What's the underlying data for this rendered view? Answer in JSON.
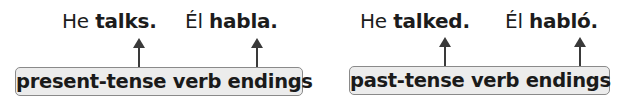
{
  "diagram": {
    "groups": [
      {
        "id": "present",
        "english": {
          "subject": "He",
          "verb": "talks."
        },
        "spanish": {
          "subject": "Él",
          "verb": "habla."
        },
        "label": "present-tense verb endings"
      },
      {
        "id": "past",
        "english": {
          "subject": "He",
          "verb": "talked."
        },
        "spanish": {
          "subject": "Él",
          "verb": "habló."
        },
        "label": "past-tense verb endings"
      }
    ],
    "colors": {
      "text": "#1c1c1c",
      "arrow": "#3a3a3a",
      "box_fill": "#ececec",
      "box_border": "#8a8a8a"
    }
  }
}
